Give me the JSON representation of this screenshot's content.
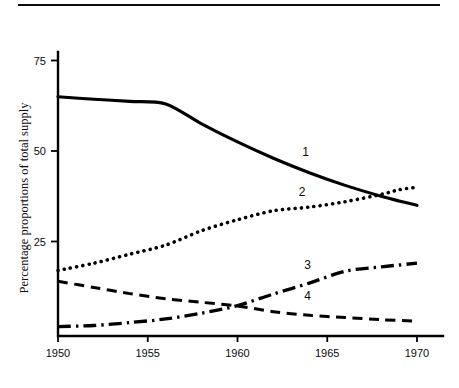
{
  "figure": {
    "has_top_rule": true,
    "background": "#ffffff",
    "ink_color": "#000000"
  },
  "chart_data": {
    "type": "line",
    "title": "",
    "xlabel": "",
    "ylabel": "Percentage proportions of total supply",
    "xlim": [
      1950,
      1970
    ],
    "ylim": [
      0,
      78
    ],
    "grid": false,
    "legend": "inline-labels",
    "x_ticks": [
      1950,
      1955,
      1960,
      1965,
      1970
    ],
    "x_tick_labels": [
      "1950",
      "1955",
      "1960",
      "1965",
      "1970"
    ],
    "y_ticks": [
      25,
      50,
      75
    ],
    "y_tick_labels": [
      "25",
      "50",
      "75"
    ],
    "series": [
      {
        "name": "1",
        "label": "1",
        "style": "solid",
        "label_x": 1963.8,
        "label_y": 48.5,
        "x": [
          1950,
          1952,
          1954,
          1956,
          1958,
          1960,
          1962,
          1964,
          1966,
          1968,
          1969,
          1970
        ],
        "values": [
          65.0,
          64.3,
          63.7,
          63.0,
          57.5,
          52.5,
          48.0,
          44.0,
          40.5,
          37.5,
          36.2,
          35.0
        ]
      },
      {
        "name": "2",
        "label": "2",
        "style": "dotted",
        "label_x": 1963.6,
        "label_y": 37.5,
        "x": [
          1950,
          1952,
          1954,
          1956,
          1958,
          1960,
          1962,
          1964,
          1966,
          1968,
          1969,
          1970
        ],
        "values": [
          17.0,
          19.0,
          21.5,
          24.0,
          28.0,
          31.0,
          33.5,
          34.5,
          36.0,
          38.0,
          39.3,
          40.0
        ]
      },
      {
        "name": "3",
        "label": "3",
        "style": "dash-dot",
        "label_x": 1963.9,
        "label_y": 17.5,
        "x": [
          1950,
          1952,
          1954,
          1956,
          1958,
          1960,
          1962,
          1964,
          1966,
          1968,
          1970
        ],
        "values": [
          1.5,
          1.8,
          2.6,
          3.6,
          5.2,
          7.3,
          10.5,
          13.5,
          16.8,
          18.0,
          19.0
        ]
      },
      {
        "name": "4",
        "label": "4",
        "style": "dashed",
        "label_x": 1963.9,
        "label_y": 8.8,
        "x": [
          1950,
          1952,
          1954,
          1956,
          1958,
          1960,
          1962,
          1964,
          1966,
          1968,
          1970
        ],
        "values": [
          14.0,
          12.3,
          10.6,
          9.2,
          8.2,
          7.2,
          5.6,
          4.6,
          4.0,
          3.4,
          3.0
        ]
      }
    ]
  }
}
